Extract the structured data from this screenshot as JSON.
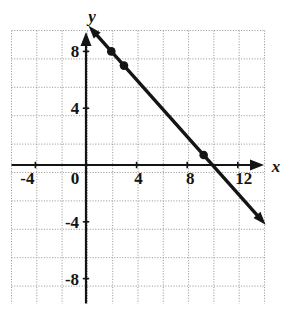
{
  "figure": {
    "name": "coordinate-plane-line-graph",
    "background_color": "#ffffff",
    "ink_color": "#141414",
    "grid_color": "#9a9a9a"
  },
  "axes": {
    "x_axis_label": "x",
    "y_axis_label": "y",
    "x_tick_labels": [
      "-4",
      "0",
      "4",
      "8",
      "12"
    ],
    "y_tick_labels": [
      "8",
      "4",
      "-4",
      "-8"
    ],
    "origin_label": "0"
  },
  "chart_data": {
    "type": "line",
    "title": "",
    "xlabel": "x",
    "ylabel": "y",
    "xlim": [
      -6,
      16
    ],
    "ylim": [
      -10,
      10
    ],
    "xticks": [
      -4,
      0,
      4,
      8,
      12
    ],
    "yticks": [
      8,
      4,
      -4,
      -8
    ],
    "grid": true,
    "grid_step": 2,
    "legend": "none",
    "series": [
      {
        "name": "line",
        "equation": "y = 10 - x",
        "slope": -1,
        "y_intercept": 10,
        "x_intercept": 10,
        "endpoints": [
          {
            "x": 0.2,
            "y": 9.8
          },
          {
            "x": 14.2,
            "y": -4.2
          }
        ],
        "arrow_start": true,
        "arrow_end": true,
        "marked_points": [
          {
            "x": 2,
            "y": 8
          },
          {
            "x": 3,
            "y": 7
          },
          {
            "x": 9.3,
            "y": 0.7
          }
        ]
      }
    ]
  }
}
